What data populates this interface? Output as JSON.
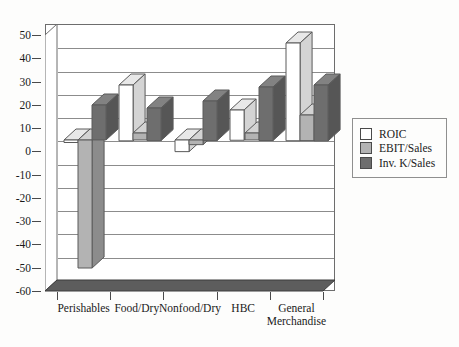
{
  "chart_data": {
    "type": "bar",
    "title": "",
    "subtitle": "",
    "xlabel": "",
    "ylabel": "",
    "categories": [
      "Perishables",
      "Food/Dry",
      "Nonfood/Dry",
      "HBC",
      "General Merchandise"
    ],
    "category_labels": [
      [
        "Perishables"
      ],
      [
        "Food/Dry"
      ],
      [
        "Nonfood/Dry"
      ],
      [
        "HBC"
      ],
      [
        "General",
        "Merchandise"
      ]
    ],
    "series": [
      {
        "name": "ROIC",
        "color": "#ffffff",
        "values": [
          0,
          24,
          -5,
          13,
          42
        ]
      },
      {
        "name": "EBIT/Sales",
        "color": "#b3b3b3",
        "values": [
          -55,
          3,
          -2,
          3,
          11
        ]
      },
      {
        "name": "Inv. K/Sales",
        "color": "#6e6e6e",
        "values": [
          15,
          14,
          17,
          23,
          24
        ]
      }
    ],
    "ylim": [
      -60,
      50
    ],
    "yticks": [
      50,
      40,
      30,
      20,
      10,
      0,
      -10,
      -20,
      -30,
      -40,
      -50,
      -60
    ],
    "ytick_labels": [
      "50",
      "40",
      "30",
      "20",
      "10",
      "0",
      "-10",
      "-20",
      "-30",
      "-40",
      "-50",
      "-60"
    ],
    "grid": true,
    "grid_axis": "y",
    "legend_position": "right",
    "legend_entries": [
      "ROIC",
      "EBIT/Sales",
      "Inv. K/Sales"
    ],
    "style": "3d-column",
    "colors": {
      "series_roic": "#ffffff",
      "series_ebit": "#b3b3b3",
      "series_invk": "#6e6e6e",
      "axis": "#4a4a4a",
      "gridline": "#8c8c8c",
      "frame": "#6d6d6d",
      "floor": "#5d5d5d",
      "text": "#1a1a1a",
      "background": "#fdfdfc"
    }
  }
}
